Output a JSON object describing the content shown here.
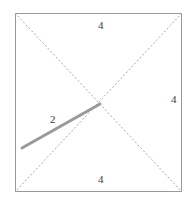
{
  "figure": {
    "name": "square-with-diagonals-and-segment",
    "background_color": "#ffffff",
    "square": {
      "name": "square-outline",
      "side_length_label": "4",
      "stroke_color": "#9a9a9a",
      "stroke_width": 1,
      "x": 15,
      "y": 13,
      "width": 167,
      "height": 179
    },
    "diagonals": {
      "name": "square-diagonals",
      "style": "dashed",
      "stroke_color": "#a8a8a8",
      "stroke_width": 1,
      "dash_pattern": "2,2",
      "lines": [
        {
          "name": "diagonal-tl-br",
          "x1": 15,
          "y1": 13,
          "x2": 182,
          "y2": 192
        },
        {
          "name": "diagonal-tr-bl",
          "x1": 182,
          "y1": 13,
          "x2": 15,
          "y2": 192
        }
      ],
      "intersection": {
        "x": 99,
        "y": 102
      }
    },
    "segment": {
      "name": "gray-segment",
      "length_label": "2",
      "stroke_color": "#9a9a9a",
      "stroke_width": 3,
      "x1": 22,
      "y1": 148,
      "x2": 100,
      "y2": 104
    },
    "labels": [
      {
        "id": "label-top",
        "name": "side-length-label-top",
        "text": "4"
      },
      {
        "id": "label-right",
        "name": "side-length-label-right",
        "text": "4"
      },
      {
        "id": "label-bottom",
        "name": "side-length-label-bottom",
        "text": "4"
      },
      {
        "id": "label-seg",
        "name": "segment-length-label",
        "text": "2"
      }
    ],
    "label_values": {
      "top": "4",
      "right": "4",
      "bottom": "4",
      "segment": "2"
    }
  }
}
